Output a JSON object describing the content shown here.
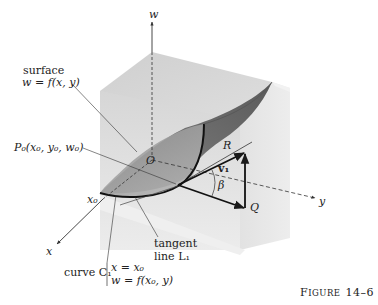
{
  "figure": {
    "caption": "FIGURE 14–6",
    "caption_small_caps": {
      "first": "F",
      "rest": "IGURE",
      "number": "14–6"
    }
  },
  "axes": {
    "w": "w",
    "x": "x",
    "y": "y",
    "origin": "O"
  },
  "labels": {
    "surface_line1": "surface",
    "surface_line2": "w = f(x, y)",
    "p0": "P₀(x₀, y₀, w₀)",
    "x0": "x₀",
    "R": "R",
    "Q": "Q",
    "v1": "v₁",
    "beta": "β",
    "tangent_line1": "tangent",
    "tangent_line2": "line  L₁",
    "curve_prefix": "curve  C₁",
    "curve_eq1": "x = x₀",
    "curve_eq2": "w = f(x₀, y)"
  },
  "colors": {
    "box_top": "#d9d9d9",
    "box_front": "#e4e4e4",
    "box_right": "#ebebeb",
    "surface_dark": "#7a7a7a",
    "surface_mid": "#a5a5a5",
    "ink": "#1a1a1a"
  }
}
